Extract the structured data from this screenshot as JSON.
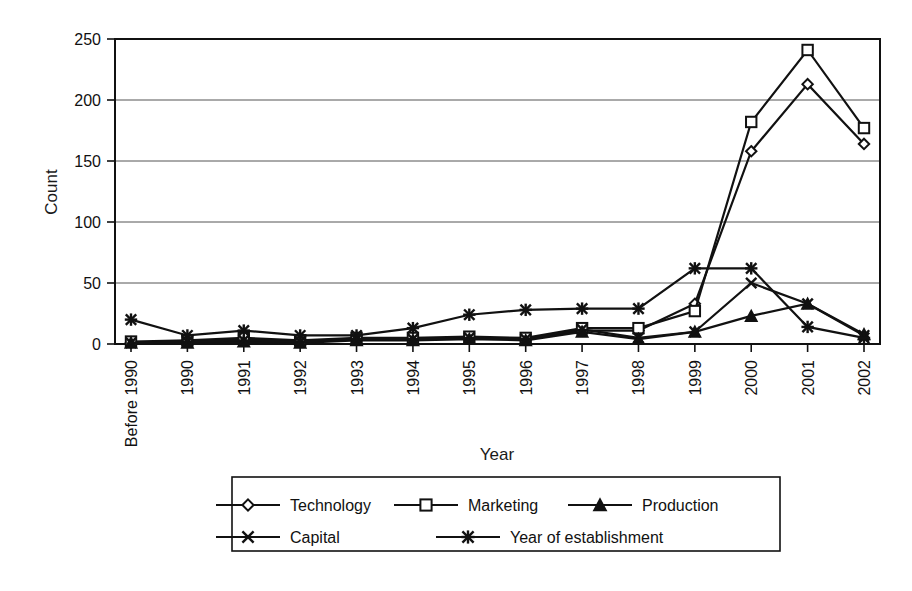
{
  "chart_data": {
    "type": "line",
    "title": "",
    "xlabel": "Year",
    "ylabel": "Count",
    "ylim": [
      0,
      250
    ],
    "yticks": [
      0,
      50,
      100,
      150,
      200,
      250
    ],
    "grid": true,
    "legend_position": "bottom",
    "categories": [
      "Before 1990",
      "1990",
      "1991",
      "1992",
      "1993",
      "1994",
      "1995",
      "1996",
      "1997",
      "1998",
      "1999",
      "2000",
      "2001",
      "2002"
    ],
    "series": [
      {
        "name": "Technology",
        "marker": "diamond-open",
        "values": [
          1,
          2,
          4,
          2,
          4,
          4,
          5,
          4,
          11,
          11,
          33,
          158,
          213,
          164
        ]
      },
      {
        "name": "Marketing",
        "marker": "square-open",
        "values": [
          2,
          3,
          5,
          3,
          5,
          5,
          6,
          5,
          13,
          13,
          27,
          182,
          241,
          177
        ]
      },
      {
        "name": "Production",
        "marker": "triangle-solid",
        "values": [
          1,
          1,
          2,
          1,
          3,
          3,
          4,
          3,
          10,
          4,
          10,
          23,
          33,
          8
        ]
      },
      {
        "name": "Capital",
        "marker": "x-cross",
        "values": [
          1,
          2,
          3,
          2,
          4,
          4,
          5,
          4,
          12,
          5,
          10,
          50,
          33,
          7
        ]
      },
      {
        "name": "Year of establishment",
        "marker": "star-asterisk",
        "values": [
          20,
          7,
          11,
          7,
          7,
          13,
          24,
          28,
          29,
          29,
          62,
          62,
          14,
          5
        ]
      }
    ]
  },
  "legend": {
    "entries": [
      {
        "label": "Technology",
        "marker": "diamond-open"
      },
      {
        "label": "Marketing",
        "marker": "square-open"
      },
      {
        "label": "Production",
        "marker": "triangle-solid"
      },
      {
        "label": "Capital",
        "marker": "x-cross"
      },
      {
        "label": "Year of establishment",
        "marker": "star-asterisk"
      }
    ]
  },
  "colors": {
    "ink": "#111111",
    "grid": "#555555",
    "background": "#ffffff"
  }
}
